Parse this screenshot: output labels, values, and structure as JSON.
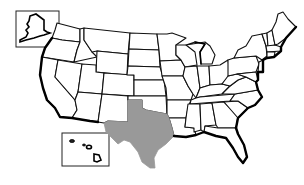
{
  "map": {
    "type": "choropleth",
    "region": "United States",
    "highlighted_states": [
      "Texas"
    ],
    "colors": {
      "highlight": "#999999",
      "default_fill": "#ffffff",
      "border": "#111111",
      "background": "#ffffff"
    },
    "insets": [
      "Alaska",
      "Hawaii"
    ],
    "labels": []
  }
}
